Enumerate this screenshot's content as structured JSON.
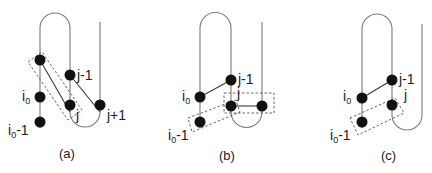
{
  "figure": {
    "panels": [
      {
        "id": "a",
        "caption": "(a)",
        "labels": {
          "i0": "i",
          "i0_sub": "0",
          "i0m1": "i",
          "i0m1_sub": "0",
          "i0m1_suffix": "-1",
          "jm1": "j-1",
          "j": "j",
          "jp1": "j+1"
        }
      },
      {
        "id": "b",
        "caption": "(b)",
        "labels": {
          "i0": "i",
          "i0_sub": "0",
          "i0m1": "i",
          "i0m1_sub": "0",
          "i0m1_suffix": "-1",
          "jm1": "j-1",
          "j": "j"
        }
      },
      {
        "id": "c",
        "caption": "(c)",
        "labels": {
          "i0": "i",
          "i0_sub": "0",
          "i0m1": "i",
          "i0m1_sub": "0",
          "i0m1_suffix": "-1",
          "jm1": "j-1",
          "j": "j"
        }
      }
    ]
  }
}
